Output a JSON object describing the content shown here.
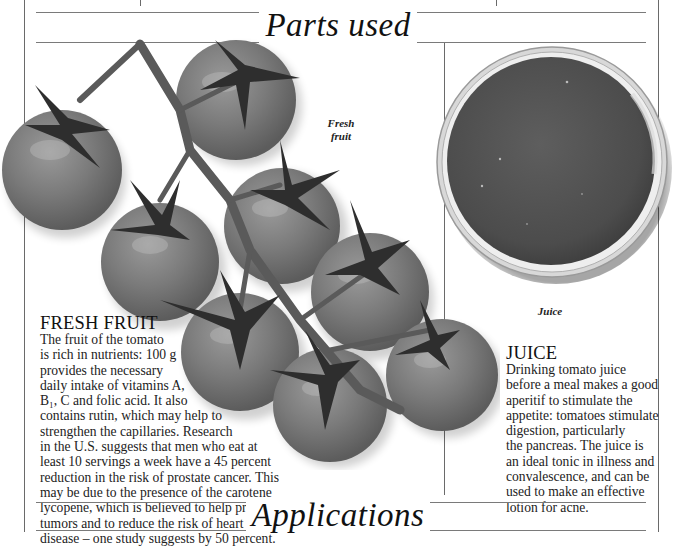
{
  "page": {
    "section_top_title": "Parts used",
    "section_bottom_title": "Applications"
  },
  "illustrations": {
    "fresh_fruit": {
      "caption_line1": "Fresh",
      "caption_line2": "fruit",
      "subject": "tomato-vine-cluster",
      "tomato_count": 9,
      "color": "#7a7a7a"
    },
    "juice": {
      "caption": "Juice",
      "subject": "bowl-of-tomato-juice",
      "color": "#555555"
    }
  },
  "entries": [
    {
      "heading": "FRESH FRUIT",
      "body": "The fruit of the tomato\nis rich in nutrients: 100 g\nprovides the necessary\ndaily intake of vitamins A,\nB₁, C and folic acid. It also\ncontains rutin, which may help to\nstrengthen the capillaries. Research\nin the U.S. suggests that men who eat at\nleast 10 servings a week have a 45 percent\nreduction in the risk of prostate cancer. This\nmay be due to the presence of the carotene\nlycopene, which is believed to help prevent\ntumors and to reduce the risk of heart\ndisease – one study suggests by 50 percent."
    },
    {
      "heading": "JUICE",
      "body": "Drinking tomato juice\nbefore a meal makes a good\naperitif to stimulate the\nappetite: tomatoes stimulate\ndigestion, particularly\nthe pancreas. The juice is\nan ideal tonic in illness and\nconvalescence, and can be\nused to make an effective\nlotion for acne."
    }
  ]
}
